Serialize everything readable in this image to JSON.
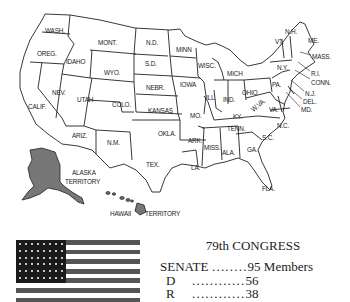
{
  "map": {
    "title": "United States",
    "states": [
      {
        "label": "WASH.",
        "x": 45,
        "y": 26
      },
      {
        "label": "OREG.",
        "x": 37,
        "y": 49
      },
      {
        "label": "IDAHO",
        "x": 66,
        "y": 57
      },
      {
        "label": "MONT.",
        "x": 98,
        "y": 38
      },
      {
        "label": "WYO.",
        "x": 104,
        "y": 68
      },
      {
        "label": "N.D.",
        "x": 146,
        "y": 38
      },
      {
        "label": "S.D.",
        "x": 145,
        "y": 59
      },
      {
        "label": "NEBR.",
        "x": 146,
        "y": 83
      },
      {
        "label": "KANSAS",
        "x": 148,
        "y": 106
      },
      {
        "label": "MINN",
        "x": 176,
        "y": 45
      },
      {
        "label": "IOWA",
        "x": 180,
        "y": 80
      },
      {
        "label": "WISC.",
        "x": 198,
        "y": 61
      },
      {
        "label": "MICH",
        "x": 227,
        "y": 69
      },
      {
        "label": "ILL.",
        "x": 206,
        "y": 93
      },
      {
        "label": "IND.",
        "x": 223,
        "y": 95
      },
      {
        "label": "OHIO",
        "x": 242,
        "y": 88
      },
      {
        "label": "PA.",
        "x": 272,
        "y": 80
      },
      {
        "label": "N.Y.",
        "x": 277,
        "y": 63
      },
      {
        "label": "VT.",
        "x": 275,
        "y": 37
      },
      {
        "label": "N.H.",
        "x": 285,
        "y": 27
      },
      {
        "label": "ME.",
        "x": 308,
        "y": 36
      },
      {
        "label": "MASS.",
        "x": 312,
        "y": 52
      },
      {
        "label": "R.I.",
        "x": 311,
        "y": 69
      },
      {
        "label": "CONN.",
        "x": 311,
        "y": 78
      },
      {
        "label": "N.J.",
        "x": 305,
        "y": 89
      },
      {
        "label": "DEL.",
        "x": 303,
        "y": 97
      },
      {
        "label": "MD.",
        "x": 301,
        "y": 105
      },
      {
        "label": "W.VA.",
        "x": 249,
        "y": 107
      },
      {
        "label": "VA.",
        "x": 269,
        "y": 105
      },
      {
        "label": "KY.",
        "x": 233,
        "y": 112
      },
      {
        "label": "TENN.",
        "x": 227,
        "y": 124
      },
      {
        "label": "N.C.",
        "x": 277,
        "y": 121
      },
      {
        "label": "S.C.",
        "x": 262,
        "y": 133
      },
      {
        "label": "GA.",
        "x": 247,
        "y": 145
      },
      {
        "label": "ALA.",
        "x": 222,
        "y": 148
      },
      {
        "label": "MISS.",
        "x": 204,
        "y": 143
      },
      {
        "label": "ARK.",
        "x": 188,
        "y": 136
      },
      {
        "label": "LA.",
        "x": 191,
        "y": 163
      },
      {
        "label": "FLA.",
        "x": 262,
        "y": 184
      },
      {
        "label": "MO.",
        "x": 190,
        "y": 111
      },
      {
        "label": "OKLA.",
        "x": 158,
        "y": 129
      },
      {
        "label": "TEX.",
        "x": 146,
        "y": 160
      },
      {
        "label": "N.M.",
        "x": 107,
        "y": 138
      },
      {
        "label": "COLO.",
        "x": 112,
        "y": 100
      },
      {
        "label": "UTAH",
        "x": 77,
        "y": 95
      },
      {
        "label": "ARIZ.",
        "x": 72,
        "y": 131
      },
      {
        "label": "NEV.",
        "x": 52,
        "y": 88
      },
      {
        "label": "CALIF.",
        "x": 28,
        "y": 102
      }
    ],
    "territories": [
      {
        "label": "ALASKA",
        "x": 72,
        "y": 168
      },
      {
        "label": "TERRITORY",
        "x": 65,
        "y": 177
      },
      {
        "label": "HAWAII",
        "x": 110,
        "y": 209
      },
      {
        "label": "TERRITORY",
        "x": 145,
        "y": 209
      }
    ]
  },
  "congress": {
    "title": "79th CONGRESS",
    "rows": [
      {
        "label": "SENATE",
        "dots": "........",
        "value": "95 Members"
      },
      {
        "label": "D",
        "dots": "............",
        "value": "56"
      },
      {
        "label": "R",
        "dots": "............",
        "value": "38"
      }
    ]
  },
  "flag": {
    "name": "US flag (48 stars)",
    "stripe_color": "#555555",
    "canton_color": "#1a1a1a"
  }
}
